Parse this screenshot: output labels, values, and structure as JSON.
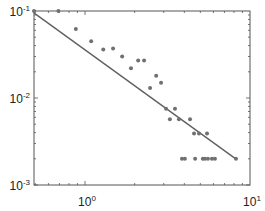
{
  "chart_data": {
    "type": "scatter",
    "title": "",
    "xlabel": "",
    "ylabel": "",
    "xscale": "log",
    "yscale": "log",
    "xlim": [
      0.49,
      10
    ],
    "ylim": [
      0.001,
      0.1
    ],
    "grid": false,
    "legend": null,
    "x_ticks": [
      {
        "base": "10",
        "exp": "0",
        "value": 1
      },
      {
        "base": "10",
        "exp": "1",
        "value": 10
      }
    ],
    "y_ticks": [
      {
        "base": "10",
        "exp": "-1",
        "value": 0.1
      },
      {
        "base": "10",
        "exp": "-2",
        "value": 0.01
      },
      {
        "base": "10",
        "exp": "-3",
        "value": 0.001
      }
    ],
    "series": [
      {
        "name": "data",
        "kind": "scatter",
        "color": "#707070",
        "points": [
          [
            0.48,
            0.1
          ],
          [
            0.69,
            0.1
          ],
          [
            0.88,
            0.062
          ],
          [
            1.09,
            0.045
          ],
          [
            1.29,
            0.036
          ],
          [
            1.48,
            0.037
          ],
          [
            1.68,
            0.03
          ],
          [
            1.9,
            0.022
          ],
          [
            2.1,
            0.027
          ],
          [
            2.28,
            0.027
          ],
          [
            2.48,
            0.013
          ],
          [
            2.7,
            0.018
          ],
          [
            2.89,
            0.015
          ],
          [
            3.1,
            0.0075
          ],
          [
            3.51,
            0.0075
          ],
          [
            3.27,
            0.0057
          ],
          [
            3.71,
            0.0057
          ],
          [
            4.33,
            0.0057
          ],
          [
            4.58,
            0.0039
          ],
          [
            4.91,
            0.0039
          ],
          [
            5.49,
            0.0039
          ],
          [
            3.87,
            0.002
          ],
          [
            4.03,
            0.002
          ],
          [
            4.65,
            0.002
          ],
          [
            5.18,
            0.002
          ],
          [
            5.33,
            0.002
          ],
          [
            5.56,
            0.002
          ],
          [
            5.88,
            0.002
          ],
          [
            6.13,
            0.002
          ],
          [
            8.22,
            0.002
          ]
        ]
      },
      {
        "name": "fit",
        "kind": "line",
        "color": "#606060",
        "points": [
          [
            0.49,
            0.095
          ],
          [
            8.2,
            0.002
          ]
        ]
      }
    ]
  }
}
